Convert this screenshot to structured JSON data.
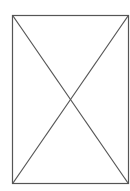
{
  "placeholder": {
    "icon": "image-placeholder-icon",
    "stroke_color": "#555555",
    "background_color": "#ffffff",
    "box": {
      "x": 12,
      "y": 15,
      "width": 117,
      "height": 169
    }
  }
}
